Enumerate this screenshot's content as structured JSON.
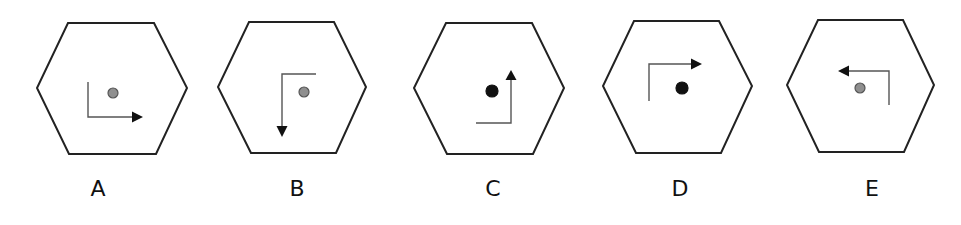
{
  "figure": {
    "type": "odd-one-out rotation puzzle",
    "colors": {
      "hexagon_stroke": "#222222",
      "arrow_stroke": "#555555",
      "arrowhead": "#111111",
      "dot_gray_fill": "#8f8f8f",
      "dot_gray_stroke": "#555555",
      "dot_black": "#111111"
    },
    "options": [
      {
        "label": "A",
        "label_x": 98,
        "hexagon": [
          [
            68,
            23
          ],
          [
            154,
            23
          ],
          [
            187,
            88
          ],
          [
            156,
            154
          ],
          [
            69,
            154
          ],
          [
            37,
            88
          ]
        ],
        "path": [
          [
            88,
            82
          ],
          [
            88,
            117
          ],
          [
            132,
            117
          ]
        ],
        "arrow_tip": [
          143,
          117
        ],
        "arrow_direction": "right",
        "dot": {
          "cx": 113,
          "cy": 93,
          "r": 5,
          "color": "gray"
        }
      },
      {
        "label": "B",
        "label_x": 297,
        "hexagon": [
          [
            249,
            22
          ],
          [
            334,
            22
          ],
          [
            366,
            87
          ],
          [
            336,
            153
          ],
          [
            251,
            153
          ],
          [
            218,
            87
          ]
        ],
        "path": [
          [
            316,
            74
          ],
          [
            282,
            74
          ],
          [
            282,
            126
          ]
        ],
        "arrow_tip": [
          282,
          137
        ],
        "arrow_direction": "down",
        "dot": {
          "cx": 304,
          "cy": 92,
          "r": 5,
          "color": "gray"
        }
      },
      {
        "label": "C",
        "label_x": 493,
        "hexagon": [
          [
            446,
            23
          ],
          [
            532,
            23
          ],
          [
            564,
            88
          ],
          [
            533,
            154
          ],
          [
            447,
            154
          ],
          [
            414,
            88
          ]
        ],
        "path": [
          [
            476,
            123
          ],
          [
            511,
            123
          ],
          [
            511,
            80
          ]
        ],
        "arrow_tip": [
          511,
          70
        ],
        "arrow_direction": "up",
        "dot": {
          "cx": 492,
          "cy": 91,
          "r": 6,
          "color": "black"
        }
      },
      {
        "label": "D",
        "label_x": 680,
        "hexagon": [
          [
            634,
            21
          ],
          [
            719,
            21
          ],
          [
            752,
            86
          ],
          [
            721,
            153
          ],
          [
            636,
            153
          ],
          [
            603,
            86
          ]
        ],
        "path": [
          [
            649,
            101
          ],
          [
            649,
            64
          ],
          [
            691,
            64
          ]
        ],
        "arrow_tip": [
          702,
          64
        ],
        "arrow_direction": "right",
        "dot": {
          "cx": 682,
          "cy": 88,
          "r": 6,
          "color": "black"
        }
      },
      {
        "label": "E",
        "label_x": 872,
        "hexagon": [
          [
            818,
            20
          ],
          [
            903,
            20
          ],
          [
            934,
            85
          ],
          [
            904,
            152
          ],
          [
            819,
            152
          ],
          [
            787,
            85
          ]
        ],
        "path": [
          [
            889,
            105
          ],
          [
            889,
            71
          ],
          [
            849,
            71
          ]
        ],
        "arrow_tip": [
          838,
          71
        ],
        "arrow_direction": "left",
        "dot": {
          "cx": 860,
          "cy": 88,
          "r": 5,
          "color": "gray"
        }
      }
    ]
  }
}
